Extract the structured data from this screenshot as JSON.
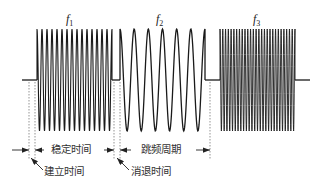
{
  "diagram": {
    "type": "frequency-hopping-waveform",
    "stroke_color": "#1a1a1a",
    "guide_color": "#555555",
    "baseline_y": 80,
    "amplitude": 51,
    "segments": [
      {
        "id": "f1",
        "label_main": "f",
        "label_sub": "1",
        "x_start": 37,
        "x_end": 112,
        "cycles": 15
      },
      {
        "id": "f2",
        "label_main": "f",
        "label_sub": "2",
        "x_start": 120,
        "x_end": 205,
        "cycles": 6
      },
      {
        "id": "f3",
        "label_main": "f",
        "label_sub": "3",
        "x_start": 220,
        "x_end": 295,
        "cycles": 27
      }
    ],
    "guides_x": [
      29,
      35,
      114,
      120,
      210
    ],
    "annotations": {
      "stable_time": "稳定时间",
      "hop_period": "跳频周期",
      "setup_time": "建立时间",
      "decay_time": "消退时间"
    }
  }
}
